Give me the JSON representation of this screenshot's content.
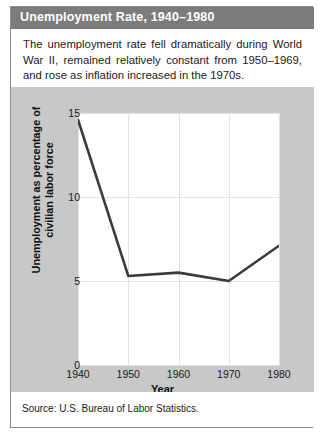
{
  "figure": {
    "title": "Unemployment Rate, 1940–1980",
    "description": "The unemployment rate fell dramatically during World War II, remained relatively constant from 1950–1969, and rose as inflation increased in the 1970s.",
    "source": "Source: U.S. Bureau of Labor Statistics.",
    "colors": {
      "header_bg": "#7c7c7c",
      "header_text": "#ffffff",
      "panel_bg": "#c8c8c8",
      "plot_bg": "#ffffff",
      "line": "#3b3b3b",
      "grid": "#e2e2e2",
      "border": "#8d8d8d"
    }
  },
  "chart_data": {
    "type": "line",
    "title": "Unemployment Rate, 1940–1980",
    "xlabel": "Year",
    "ylabel": "Unemployment as percentage of civilian labor force",
    "x": [
      1940,
      1950,
      1960,
      1970,
      1980
    ],
    "values": [
      14.6,
      5.3,
      5.5,
      5.0,
      7.1
    ],
    "xtick_labels": [
      "1940",
      "1950",
      "1960",
      "1970",
      "1980"
    ],
    "ytick_labels": [
      "0",
      "5",
      "10",
      "15"
    ],
    "yticks": [
      0,
      5,
      10,
      15
    ],
    "xlim": [
      1940,
      1980
    ],
    "ylim": [
      0,
      15
    ],
    "grid": true,
    "legend": "none",
    "series": [
      {
        "name": "Unemployment rate",
        "values": [
          14.6,
          5.3,
          5.5,
          5.0,
          7.1
        ]
      }
    ]
  }
}
